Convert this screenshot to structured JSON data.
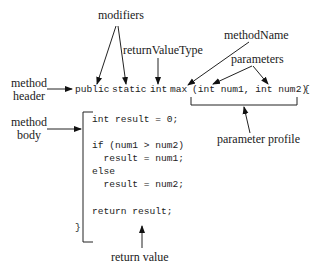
{
  "labels": {
    "modifiers": "modifiers",
    "return_value_type": "returnValueType",
    "method_name": "methodName",
    "parameters": "parameters",
    "method_header_line1": "method",
    "method_header_line2": "header",
    "method_body_line1": "method",
    "method_body_line2": "body",
    "parameter_profile": "parameter profile",
    "return_value": "return value"
  },
  "code": {
    "header_public": "public",
    "header_static": "static",
    "header_int": "int",
    "header_max": "max",
    "header_params": "(int num1, int num2)",
    "header_brace": "{",
    "body_lines": [
      "int result = 0;",
      "",
      "if (num1 > num2)",
      "  result = num1;",
      "else",
      "  result = num2;",
      "",
      "return result;"
    ],
    "closing_brace": "}"
  }
}
